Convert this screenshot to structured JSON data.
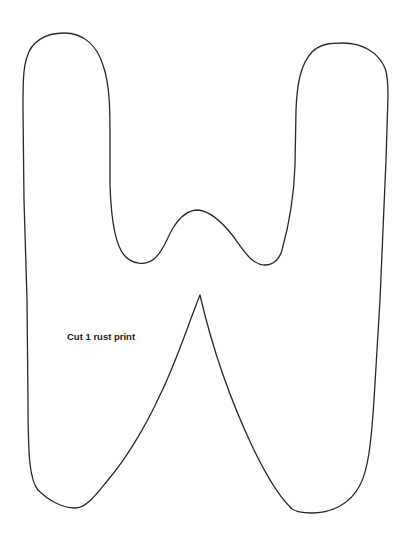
{
  "template": {
    "letter": "W",
    "instruction": "Cut 1 rust print",
    "stroke_color": "#222222",
    "background_color": "#ffffff"
  }
}
